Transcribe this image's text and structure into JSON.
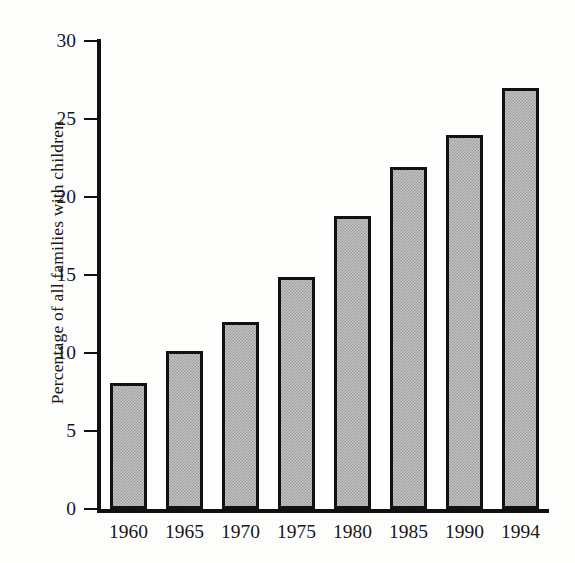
{
  "chart_data": {
    "type": "bar",
    "title": "",
    "subtitle": "",
    "xlabel": "",
    "ylabel": "Percentage of all families with children",
    "categories": [
      "1960",
      "1965",
      "1970",
      "1975",
      "1980",
      "1985",
      "1990",
      "1994"
    ],
    "values": [
      8.1,
      10.1,
      12.0,
      14.9,
      18.8,
      21.9,
      24.0,
      27.0
    ],
    "series": [
      {
        "name": "Percentage of all families with children",
        "values": [
          8.1,
          10.1,
          12.0,
          14.9,
          18.8,
          21.9,
          24.0,
          27.0
        ]
      }
    ],
    "ylim": [
      0,
      30
    ],
    "ytick_labels": [
      "0",
      "5",
      "10",
      "15",
      "20",
      "25",
      "30"
    ],
    "ytick_values": [
      0,
      5,
      10,
      15,
      20,
      25,
      30
    ],
    "xtick_labels": [
      "1960",
      "1965",
      "1970",
      "1975",
      "1980",
      "1985",
      "1990",
      "1994"
    ],
    "grid": false,
    "legend": false,
    "legend_position": "none",
    "annotations": [],
    "colors": {
      "bar_fill": "#c3c3c3",
      "bar_pattern": "#9b9b9b",
      "bar_edge": "#111111",
      "axis": "#111111",
      "text": "#18181a",
      "background": "#fdfdfb"
    }
  }
}
